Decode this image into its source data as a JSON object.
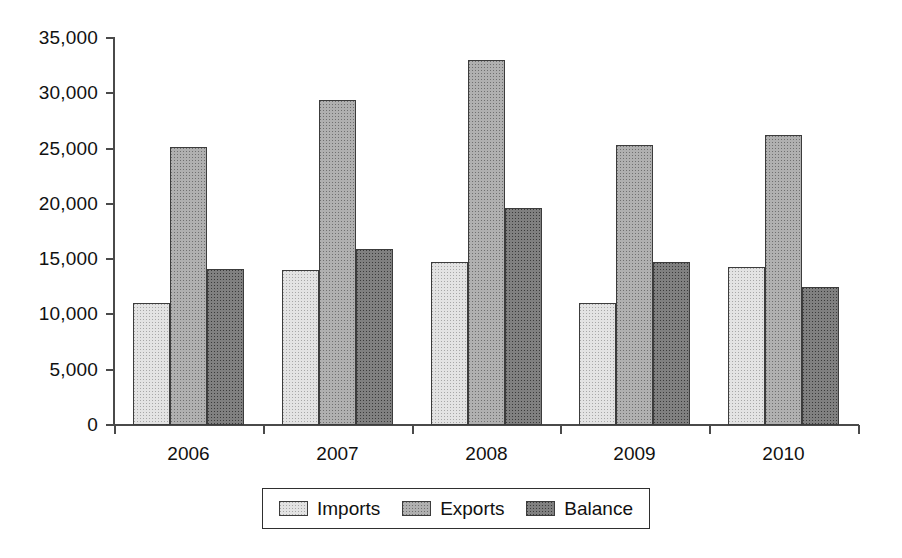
{
  "chart_data": {
    "type": "bar",
    "title": "",
    "subtitle": "",
    "xlabel": "",
    "ylabel": "",
    "categories": [
      "2006",
      "2007",
      "2008",
      "2009",
      "2010"
    ],
    "series": [
      {
        "name": "Imports",
        "color": "#e3e3e3",
        "values": [
          11000,
          14000,
          14700,
          11050,
          14250
        ]
      },
      {
        "name": "Exports",
        "color": "#b0b0b0",
        "values": [
          25100,
          29400,
          33000,
          25350,
          26200
        ]
      },
      {
        "name": "Balance",
        "color": "#808080",
        "values": [
          14150,
          15950,
          19600,
          14700,
          12500
        ]
      }
    ],
    "ylim": [
      0,
      35000
    ],
    "ytick_values": [
      0,
      5000,
      10000,
      15000,
      20000,
      25000,
      30000,
      35000
    ],
    "ytick_labels": [
      "0",
      "5,000",
      "10,000",
      "15,000",
      "20,000",
      "25,000",
      "30,000",
      "35,000"
    ],
    "grid": false,
    "legend_position": "bottom",
    "legend_entries": [
      "Imports",
      "Exports",
      "Balance"
    ]
  },
  "axis": {
    "y_ticks": [
      {
        "label": "35,000",
        "value": 35000
      },
      {
        "label": "30,000",
        "value": 30000
      },
      {
        "label": "25,000",
        "value": 25000
      },
      {
        "label": "20,000",
        "value": 20000
      },
      {
        "label": "15,000",
        "value": 15000
      },
      {
        "label": "10,000",
        "value": 10000
      },
      {
        "label": "5,000",
        "value": 5000
      },
      {
        "label": "0",
        "value": 0
      }
    ]
  },
  "legend": {
    "items": [
      {
        "label": "Imports",
        "swatch": "imports-swatch"
      },
      {
        "label": "Exports",
        "swatch": "exports-swatch"
      },
      {
        "label": "Balance",
        "swatch": "balance-swatch"
      }
    ]
  }
}
